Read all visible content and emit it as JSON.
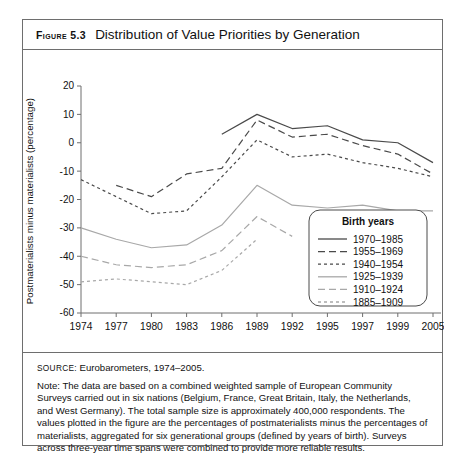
{
  "figure": {
    "label": "Figure 5.3",
    "title": "Distribution of Value Priorities by Generation"
  },
  "source": {
    "tag": "Source:",
    "text": "Eurobarometers, 1974–2005."
  },
  "note": {
    "text": "Note: The data are based on a combined weighted sample of European Community Surveys carried out in six nations (Belgium, France, Great Britain, Italy, the Netherlands, and West Germany). The total sample size is approximately 400,000 respondents. The values plotted in the figure are the percentages of postmaterialists minus the percentages of materialists, aggregated for six generational groups (defined by years of birth). Surveys across three-year time spans were combined to provide more reliable results."
  },
  "colors": {
    "dark_line": "#4a4a4a",
    "light_line": "#a8a8a8",
    "axis": "#6e6e6e",
    "border": "#6e6e6e",
    "text": "#111111"
  },
  "chart_data": {
    "type": "line",
    "title": "Distribution of Value Priorities by Generation",
    "xlabel": "",
    "ylabel": "Postmaterialists minus materialists (percentage)",
    "legend_title": "Birth years",
    "legend_position": "bottom-right",
    "grid": false,
    "ylim": [
      -60,
      20
    ],
    "yticks": [
      20,
      10,
      0,
      -10,
      -20,
      -30,
      -40,
      -50,
      -60
    ],
    "categories": [
      1974,
      1977,
      1980,
      1983,
      1986,
      1989,
      1992,
      1995,
      1997,
      1999,
      2005
    ],
    "xtick_labels": [
      "1974",
      "1977",
      "1980",
      "1983",
      "1986",
      "1989",
      "1992",
      "1995",
      "1997",
      "1999",
      "2005"
    ],
    "series": [
      {
        "name": "1970–1985",
        "style": "solid",
        "color": "#4a4a4a",
        "x": [
          1986,
          1989,
          1992,
          1995,
          1997,
          1999,
          2005
        ],
        "values": [
          3,
          10,
          5,
          6,
          1,
          0,
          -7
        ]
      },
      {
        "name": "1955–1969",
        "style": "dashed",
        "color": "#4a4a4a",
        "x": [
          1977,
          1980,
          1983,
          1986,
          1989,
          1992,
          1995,
          1997,
          1999,
          2005
        ],
        "values": [
          -15,
          -19,
          -11,
          -9,
          8,
          2,
          3,
          -1,
          -4,
          -11
        ]
      },
      {
        "name": "1940–1954",
        "style": "dotted",
        "color": "#4a4a4a",
        "x": [
          1974,
          1977,
          1980,
          1983,
          1986,
          1989,
          1992,
          1995,
          1997,
          1999,
          2005
        ],
        "values": [
          -13,
          -19,
          -25,
          -24,
          -12,
          1,
          -5,
          -4,
          -7,
          -9,
          -12
        ]
      },
      {
        "name": "1925–1939",
        "style": "solid",
        "color": "#a8a8a8",
        "x": [
          1974,
          1977,
          1980,
          1983,
          1986,
          1989,
          1992,
          1995,
          1997,
          1999,
          2005
        ],
        "values": [
          -30,
          -34,
          -37,
          -36,
          -29,
          -15,
          -22,
          -23,
          -22,
          -24,
          -24
        ]
      },
      {
        "name": "1910–1924",
        "style": "dashed",
        "color": "#a8a8a8",
        "x": [
          1974,
          1977,
          1980,
          1983,
          1986,
          1989,
          1992
        ],
        "values": [
          -40,
          -43,
          -44,
          -43,
          -38,
          -26,
          -33
        ]
      },
      {
        "name": "1885–1909",
        "style": "dotted",
        "color": "#a8a8a8",
        "x": [
          1974,
          1977,
          1980,
          1983,
          1986,
          1989
        ],
        "values": [
          -49,
          -48,
          -49,
          -50,
          -45,
          -34
        ]
      }
    ]
  }
}
